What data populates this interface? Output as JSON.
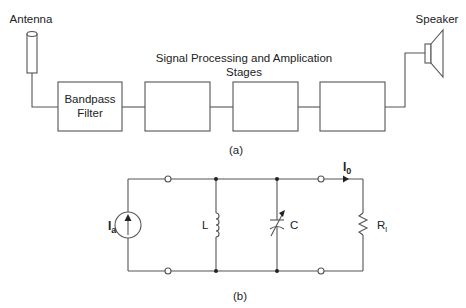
{
  "figure_a": {
    "caption": "(a)",
    "antenna_label": "Antenna",
    "speaker_label": "Speaker",
    "stages_label_line1": "Signal Processing and Amplication",
    "stages_label_line2": "Stages",
    "blocks": [
      {
        "line1": "Bandpass",
        "line2": "Filter"
      },
      {
        "line1": "",
        "line2": ""
      },
      {
        "line1": "",
        "line2": ""
      },
      {
        "line1": "",
        "line2": ""
      }
    ]
  },
  "figure_b": {
    "caption": "(b)",
    "source_label": "I",
    "source_sub": "a",
    "inductor_label": "L",
    "capacitor_label": "C",
    "load_label": "R",
    "load_sub": "l",
    "output_current_label": "I",
    "output_current_sub": "0"
  }
}
